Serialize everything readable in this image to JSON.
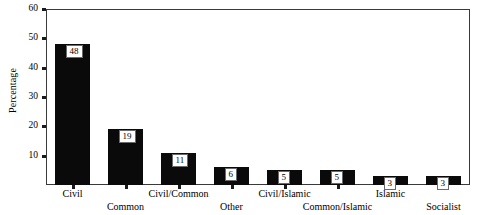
{
  "chart_data": {
    "type": "bar",
    "title": "",
    "subtitle": "",
    "xlabel": "",
    "ylabel": "Percentage",
    "categories": [
      "Civil",
      "Common",
      "Civil/Common",
      "Other",
      "Civil/Islamic",
      "Common/Islamic",
      "Islamic",
      "Socialist"
    ],
    "values": [
      48,
      19,
      11,
      6,
      5,
      5,
      3,
      3
    ],
    "value_labels": [
      "48",
      "19",
      "11",
      "6",
      "5",
      "5",
      "3",
      "3"
    ],
    "ylim": [
      0,
      60
    ],
    "yticks": [
      10,
      20,
      30,
      40,
      50,
      60
    ],
    "ytick_labels": [
      "10",
      "20",
      "30",
      "40",
      "50",
      "60"
    ],
    "grid": false,
    "legend": null,
    "legend_position": "none",
    "bar_color": "#0a0a0a",
    "frame_color": "#3a3a3a",
    "background": "#ffffff",
    "label_stagger": [
      0,
      1,
      0,
      1,
      0,
      1,
      0,
      1
    ]
  }
}
